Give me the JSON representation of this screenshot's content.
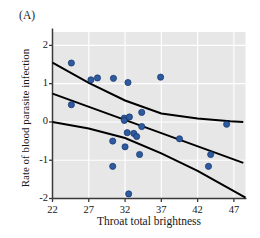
{
  "figure": {
    "panel_label": "(A)",
    "background_color": "#ffffff"
  },
  "chart_data": {
    "type": "scatter",
    "title": "",
    "panel": "(A)",
    "xlabel": "Throat total brightness",
    "ylabel": "Rate of blood parasite infection",
    "xlim": [
      22,
      48.6
    ],
    "ylim": [
      -2,
      2.35
    ],
    "xticks": [
      22,
      27,
      32,
      37,
      42,
      47
    ],
    "yticks": [
      2,
      1,
      0,
      -1,
      -2
    ],
    "xtick_labels": [
      "22",
      "27",
      "32",
      "37",
      "42",
      "47"
    ],
    "ytick_labels": [
      "2",
      "1",
      "0",
      "-1",
      "-2"
    ],
    "grid": true,
    "grid_color": "#ffffff",
    "plot_background": "#e7e7e7",
    "legend": null,
    "point_color": "#2d5b9e",
    "point_edge_color": "#14326b",
    "point_radius": 3.1,
    "points": [
      {
        "x": 24.6,
        "y": 1.54
      },
      {
        "x": 24.6,
        "y": 0.45
      },
      {
        "x": 27.3,
        "y": 1.1
      },
      {
        "x": 28.2,
        "y": 1.15
      },
      {
        "x": 30.3,
        "y": -0.5
      },
      {
        "x": 30.4,
        "y": 1.14
      },
      {
        "x": 30.3,
        "y": -1.16
      },
      {
        "x": 31.9,
        "y": 0.1
      },
      {
        "x": 31.9,
        "y": 0.04
      },
      {
        "x": 32.0,
        "y": -0.65
      },
      {
        "x": 32.4,
        "y": 1.03
      },
      {
        "x": 32.6,
        "y": 0.13
      },
      {
        "x": 32.3,
        "y": -0.28
      },
      {
        "x": 32.5,
        "y": -1.88
      },
      {
        "x": 33.2,
        "y": -0.3
      },
      {
        "x": 33.6,
        "y": -0.38
      },
      {
        "x": 34.0,
        "y": -0.85
      },
      {
        "x": 34.3,
        "y": 0.25
      },
      {
        "x": 34.3,
        "y": -0.12
      },
      {
        "x": 36.9,
        "y": 1.17
      },
      {
        "x": 39.5,
        "y": -0.44
      },
      {
        "x": 43.8,
        "y": -0.85
      },
      {
        "x": 43.5,
        "y": -1.16
      },
      {
        "x": 46.0,
        "y": -0.06
      }
    ],
    "lines": [
      {
        "name": "upper-confidence-band",
        "color": "#000000",
        "width": 2.0,
        "points": [
          {
            "x": 22.0,
            "y": 1.55
          },
          {
            "x": 27.0,
            "y": 1.02
          },
          {
            "x": 32.0,
            "y": 0.56
          },
          {
            "x": 37.0,
            "y": 0.22
          },
          {
            "x": 42.0,
            "y": 0.09
          },
          {
            "x": 46.5,
            "y": 0.02
          },
          {
            "x": 48.3,
            "y": 0.0
          }
        ]
      },
      {
        "name": "regression-line",
        "color": "#000000",
        "width": 2.0,
        "points": [
          {
            "x": 22.0,
            "y": 0.74
          },
          {
            "x": 48.3,
            "y": -1.07
          }
        ]
      },
      {
        "name": "lower-confidence-band",
        "color": "#000000",
        "width": 2.0,
        "points": [
          {
            "x": 22.0,
            "y": 0.0
          },
          {
            "x": 27.0,
            "y": -0.17
          },
          {
            "x": 32.0,
            "y": -0.42
          },
          {
            "x": 37.0,
            "y": -0.82
          },
          {
            "x": 42.0,
            "y": -1.28
          },
          {
            "x": 48.6,
            "y": -1.98
          }
        ]
      }
    ]
  }
}
